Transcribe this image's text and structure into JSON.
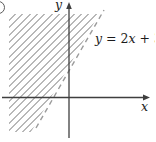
{
  "figure": {
    "axis_labels": {
      "x": "x",
      "y": "y"
    },
    "equation": {
      "text": "y = 2x + 3",
      "parts": [
        {
          "text": "y",
          "italic": true
        },
        {
          "text": " = 2",
          "italic": false
        },
        {
          "text": "x",
          "italic": true
        },
        {
          "text": " + 3",
          "italic": false
        }
      ]
    },
    "icons": {
      "corner_mark": "partial-circle-label-fragment"
    },
    "colors": {
      "axis": "#3f3f3f",
      "boundary_line": "#9b9b9b",
      "hatch": "#b8b8b8",
      "text": "#1b1b1b",
      "background": "#ffffff"
    }
  },
  "chart_data": {
    "type": "line",
    "title": "",
    "xlabel": "x",
    "ylabel": "y",
    "grid": false,
    "axis_ticks": "none",
    "series": [
      {
        "name": "y = 2x + 3",
        "equation": "y = 2x + 3",
        "slope": 2,
        "intercept": 3,
        "points": [
          [
            -1.5,
            0
          ],
          [
            0,
            3
          ]
        ],
        "style": "dashed",
        "label_position": "right-of-line-upper"
      }
    ],
    "shaded_region": {
      "relation": "above line (y > 2x + 3)",
      "pattern": "diagonal-hatch-45deg",
      "boundary": "dashed (open / strict inequality)"
    }
  }
}
